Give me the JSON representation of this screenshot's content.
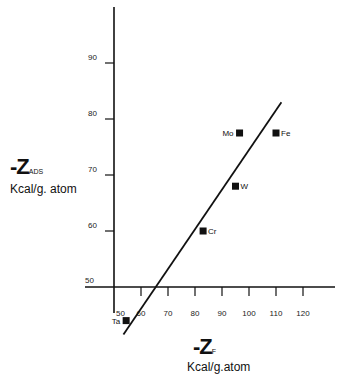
{
  "chart_data": {
    "type": "scatter",
    "title": "",
    "xlabel": "-Z_F Kcal/g.atom",
    "ylabel": "-Z_ADS Kcal/g.atom",
    "x_axis": {
      "symbol": "-Z",
      "subscript": "F",
      "units": "Kcal/g.atom",
      "range": [
        40,
        130
      ],
      "ticks": [
        50,
        60,
        70,
        80,
        90,
        100,
        110,
        120
      ]
    },
    "y_axis": {
      "symbol": "-Z",
      "subscript": "ADS",
      "units": "Kcal/g.atom",
      "range": [
        40,
        100
      ],
      "ticks": [
        50,
        60,
        70,
        80,
        90
      ]
    },
    "grid": false,
    "legend": null,
    "points": [
      {
        "label": "Mo",
        "x": 96.5,
        "y": 77.5,
        "label_side": "left"
      },
      {
        "label": "Fe",
        "x": 110,
        "y": 77.5,
        "label_side": "right"
      },
      {
        "label": "W",
        "x": 95,
        "y": 68,
        "label_side": "right"
      },
      {
        "label": "Cr",
        "x": 83,
        "y": 60,
        "label_side": "right"
      },
      {
        "label": "Ta",
        "x": 54.5,
        "y": 44,
        "label_side": "left"
      }
    ],
    "fit_line": {
      "x1": 53.5,
      "y1": 41.5,
      "x2": 112,
      "y2": 83
    }
  },
  "labels": {
    "y_symbol": "-Z",
    "y_sub": "ADS",
    "y_units": "Kcal/g. atom",
    "x_symbol": "-Z",
    "x_sub": "F",
    "x_units": "Kcal/g.atom"
  }
}
